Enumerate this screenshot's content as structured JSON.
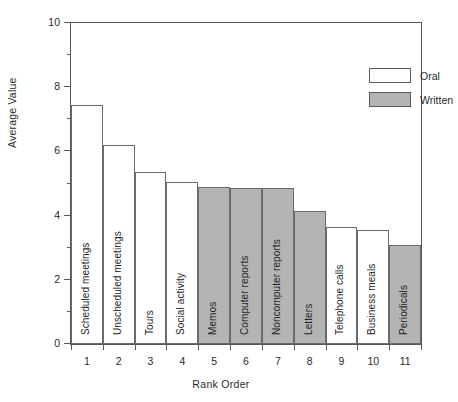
{
  "chart_data": {
    "type": "bar",
    "title": "",
    "xlabel": "Rank Order",
    "ylabel": "Average Value",
    "ylim": [
      0,
      10
    ],
    "yticks": [
      0,
      2,
      4,
      6,
      8,
      10
    ],
    "yticks_minor": [
      1,
      3,
      5,
      7,
      9
    ],
    "grid": false,
    "legend_position": "top-right",
    "categories": [
      "1",
      "2",
      "3",
      "4",
      "5",
      "6",
      "7",
      "8",
      "9",
      "10",
      "11"
    ],
    "values": [
      7.45,
      6.2,
      5.35,
      5.05,
      4.9,
      4.85,
      4.85,
      4.15,
      3.65,
      3.55,
      3.1
    ],
    "bar_labels": [
      "Scheduled meetings",
      "Unscheduled meetings",
      "Tours",
      "Social activity",
      "Memos",
      "Computer reports",
      "Noncomputer reports",
      "Letters",
      "Telephone calls",
      "Business meals",
      "Periodicals"
    ],
    "bar_groups": [
      "Oral",
      "Oral",
      "Oral",
      "Oral",
      "Written",
      "Written",
      "Written",
      "Written",
      "Oral",
      "Oral",
      "Written"
    ],
    "legend": [
      {
        "label": "Oral",
        "color": "#ffffff"
      },
      {
        "label": "Written",
        "color": "#b4b4b4"
      }
    ]
  },
  "axes": {
    "x_title": "Rank Order",
    "y_title": "Average Value"
  }
}
